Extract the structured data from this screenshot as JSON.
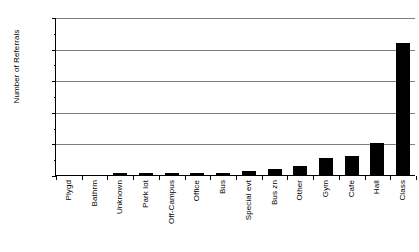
{
  "chart_data": {
    "type": "bar",
    "title": "",
    "subtitle": "",
    "xlabel": "",
    "ylabel": "Number of Referrals",
    "ylim": [
      0,
      1000
    ],
    "ytick_labels": [
      "0",
      "200",
      "400",
      "600",
      "800",
      "1000"
    ],
    "ytick_values": [
      0,
      200,
      400,
      600,
      800,
      1000
    ],
    "yminor_values": [
      100,
      300,
      500,
      700,
      900
    ],
    "grid": "horizontal",
    "legend": "none",
    "bar_color": "#000000",
    "gridline_color": "#808080",
    "axis_color": "#000000",
    "background_color": "#ffffff",
    "categories": [
      "Plygd",
      "Bathrm",
      "Unknown",
      "Park lot",
      "Off-Campus",
      "Office",
      "Bus",
      "Special evt",
      "Bus zn",
      "Other",
      "Gym",
      "Cafe",
      "Hall",
      "Class"
    ],
    "values": [
      0,
      0,
      10,
      10,
      10,
      10,
      12,
      25,
      35,
      60,
      110,
      120,
      205,
      835
    ]
  }
}
